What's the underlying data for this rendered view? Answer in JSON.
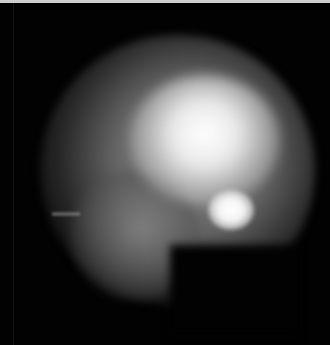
{
  "image": {
    "description": "Grayscale blurred glowing blob on a black background",
    "colors": {
      "background": "#020202",
      "halo": "#8a8a8a",
      "core": "#ffffff",
      "top_border": "#cfcfcf"
    }
  }
}
